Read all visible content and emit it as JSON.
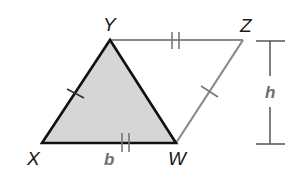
{
  "diagram": {
    "type": "parallelogram with shaded triangle",
    "vertices": {
      "X": {
        "label": "X",
        "x": 42,
        "y": 143
      },
      "Y": {
        "label": "Y",
        "x": 110,
        "y": 40
      },
      "Z": {
        "label": "Z",
        "x": 243,
        "y": 40
      },
      "W": {
        "label": "W",
        "x": 176,
        "y": 143
      }
    },
    "shaded_region": "triangle XYW",
    "measurements": {
      "base": {
        "label": "b",
        "segment": "XW"
      },
      "height": {
        "label": "h"
      }
    },
    "congruence_marks": {
      "single": [
        "XY",
        "WZ"
      ],
      "double": [
        "YZ",
        "XW"
      ]
    },
    "colors": {
      "triangle_fill": "#d6d6d6",
      "triangle_stroke": "#111111",
      "outer_stroke": "#8a8a8a",
      "measure_stroke": "#555555",
      "measure_label": "#6e6e6e"
    }
  }
}
